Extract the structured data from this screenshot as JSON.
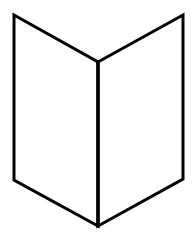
{
  "figure": {
    "stroke_color": "#000000",
    "background_color": "#ffffff",
    "stroke_width": 3,
    "vertices": {
      "top_left": [
        14,
        15
      ],
      "top_right": [
        183,
        15
      ],
      "fold_top": [
        98,
        62
      ],
      "bottom_left": [
        14,
        180
      ],
      "bottom_right": [
        183,
        179
      ],
      "fold_bottom": [
        98,
        226
      ]
    }
  }
}
